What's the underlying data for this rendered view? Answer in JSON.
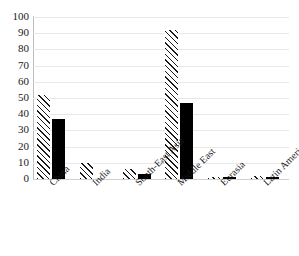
{
  "chart_data": {
    "type": "bar",
    "title": "",
    "subtitle": "",
    "xlabel": "",
    "ylabel": "",
    "categories": [
      "China",
      "India",
      "South-East Asia",
      "Middle East",
      "Eurasia",
      "Latin America"
    ],
    "series": [
      {
        "name": "series-1-hatched",
        "pattern": "diagonal-hatch",
        "color": "#ffffff",
        "values": [
          52,
          10,
          6,
          92,
          1,
          2
        ]
      },
      {
        "name": "series-2-solid",
        "pattern": "solid",
        "color": "#000000",
        "values": [
          37,
          0,
          3,
          47,
          1,
          1.5
        ]
      }
    ],
    "ylim": [
      0,
      100
    ],
    "yticks": [
      0,
      10,
      20,
      30,
      40,
      50,
      60,
      70,
      80,
      90,
      100
    ],
    "ytick_labels": [
      "0",
      "10",
      "20",
      "30",
      "40",
      "50",
      "60",
      "70",
      "80",
      "90",
      "100"
    ],
    "grid": true,
    "grid_axis": "y",
    "legend": false,
    "legend_position": "none"
  }
}
